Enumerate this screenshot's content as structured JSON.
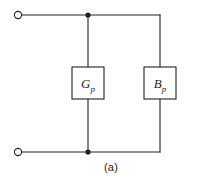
{
  "figure": {
    "caption": "(a)",
    "colors": {
      "wire": "#231f20",
      "background": "#ffffff",
      "fill": "#ffffff"
    }
  },
  "components": [
    {
      "id": "conductance",
      "symbol": "G",
      "subscript": "p",
      "label": "G_p",
      "type": "rectangular-element",
      "position": {
        "x": 72,
        "y": 67,
        "width": 32,
        "height": 32
      }
    },
    {
      "id": "susceptance",
      "symbol": "B",
      "subscript": "p",
      "label": "B_p",
      "type": "rectangular-element",
      "position": {
        "x": 144,
        "y": 67,
        "width": 32,
        "height": 32
      }
    }
  ],
  "terminals": [
    {
      "id": "terminal-top",
      "cx": 18,
      "cy": 15,
      "r": 3.6
    },
    {
      "id": "terminal-bottom",
      "cx": 18,
      "cy": 152,
      "r": 3.6
    }
  ],
  "junctions": [
    {
      "id": "junction-top",
      "cx": 88,
      "cy": 15,
      "r": 2.6
    },
    {
      "id": "junction-bottom",
      "cx": 88,
      "cy": 152,
      "r": 2.6
    }
  ],
  "wires": [
    {
      "id": "top-rail",
      "d": "M 21.6 15 L 160 15"
    },
    {
      "id": "bottom-rail",
      "d": "M 21.6 152 L 160 152"
    },
    {
      "id": "conductance-branch-upper",
      "d": "M 88 15 L 88 67"
    },
    {
      "id": "conductance-branch-lower",
      "d": "M 88 99 L 88 152"
    },
    {
      "id": "susceptance-branch-upper",
      "d": "M 160 15 L 160 67"
    },
    {
      "id": "susceptance-branch-lower",
      "d": "M 160 99 L 160 152"
    }
  ]
}
